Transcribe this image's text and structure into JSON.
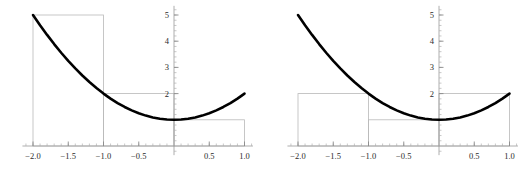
{
  "figure": {
    "title": "",
    "background": "#ffffff",
    "curve_color": "#000000",
    "rect_color": "#b9b9b9",
    "axis_color": "#9a9a9a",
    "label_color": "#2b2b2b"
  },
  "chart_data": [
    {
      "type": "line",
      "panel": "left",
      "title": "",
      "subtitle": "",
      "xlabel": "",
      "ylabel": "",
      "xlim": [
        -2.15,
        1.12
      ],
      "ylim": [
        -0.35,
        5.35
      ],
      "grid": false,
      "legend": null,
      "function": "f(x) = x^2 + 1",
      "x_ticks": [
        -2.0,
        -1.5,
        -1.0,
        -0.5,
        0.5,
        1.0
      ],
      "x_tick_labels": [
        "-2.0",
        "-1.5",
        "-1.0",
        "-0.5",
        "0.5",
        "1.0"
      ],
      "y_ticks": [
        1,
        2,
        3,
        4,
        5
      ],
      "y_tick_labels": [
        "1",
        "2",
        "3",
        "4",
        "5"
      ],
      "y_tick_labels_shown": [
        "2",
        "3",
        "4",
        "5"
      ],
      "x_minor_step": 0.1,
      "y_minor_step": 0.2,
      "series": [
        {
          "name": "f(x) = x^2 + 1",
          "x": [
            -2.0,
            -1.9,
            -1.8,
            -1.7,
            -1.6,
            -1.5,
            -1.4,
            -1.3,
            -1.2,
            -1.1,
            -1.0,
            -0.9,
            -0.8,
            -0.7,
            -0.6,
            -0.5,
            -0.4,
            -0.3,
            -0.2,
            -0.1,
            0.0,
            0.1,
            0.2,
            0.3,
            0.4,
            0.5,
            0.6,
            0.7,
            0.8,
            0.9,
            1.0
          ],
          "values": [
            5.0,
            4.61,
            4.24,
            3.89,
            3.56,
            3.25,
            2.96,
            2.69,
            2.44,
            2.21,
            2.0,
            1.81,
            1.64,
            1.49,
            1.36,
            1.25,
            1.16,
            1.09,
            1.04,
            1.01,
            1.0,
            1.01,
            1.04,
            1.09,
            1.16,
            1.25,
            1.36,
            1.49,
            1.64,
            1.81,
            2.0
          ]
        }
      ],
      "rectangles": {
        "rule": "left-endpoint",
        "count": 3,
        "width": 1.0,
        "items": [
          {
            "x0": -2.0,
            "x1": -1.0,
            "height": 5.0
          },
          {
            "x0": -1.0,
            "x1": 0.0,
            "height": 2.0
          },
          {
            "x0": 0.0,
            "x1": 1.0,
            "height": 1.0
          }
        ],
        "sum": 8.0
      }
    },
    {
      "type": "line",
      "panel": "right",
      "title": "",
      "subtitle": "",
      "xlabel": "",
      "ylabel": "",
      "xlim": [
        -2.15,
        1.12
      ],
      "ylim": [
        -0.35,
        5.35
      ],
      "grid": false,
      "legend": null,
      "function": "f(x) = x^2 + 1",
      "x_ticks": [
        -2.0,
        -1.5,
        -1.0,
        -0.5,
        0.5,
        1.0
      ],
      "x_tick_labels": [
        "-2.0",
        "-1.5",
        "-1.0",
        "-0.5",
        "0.5",
        "1.0"
      ],
      "y_ticks": [
        1,
        2,
        3,
        4,
        5
      ],
      "y_tick_labels": [
        "1",
        "2",
        "3",
        "4",
        "5"
      ],
      "y_tick_labels_shown": [
        "2",
        "3",
        "4",
        "5"
      ],
      "x_minor_step": 0.1,
      "y_minor_step": 0.2,
      "series": [
        {
          "name": "f(x) = x^2 + 1",
          "x": [
            -2.0,
            -1.9,
            -1.8,
            -1.7,
            -1.6,
            -1.5,
            -1.4,
            -1.3,
            -1.2,
            -1.1,
            -1.0,
            -0.9,
            -0.8,
            -0.7,
            -0.6,
            -0.5,
            -0.4,
            -0.3,
            -0.2,
            -0.1,
            0.0,
            0.1,
            0.2,
            0.3,
            0.4,
            0.5,
            0.6,
            0.7,
            0.8,
            0.9,
            1.0
          ],
          "values": [
            5.0,
            4.61,
            4.24,
            3.89,
            3.56,
            3.25,
            2.96,
            2.69,
            2.44,
            2.21,
            2.0,
            1.81,
            1.64,
            1.49,
            1.36,
            1.25,
            1.16,
            1.09,
            1.04,
            1.01,
            1.0,
            1.01,
            1.04,
            1.09,
            1.16,
            1.25,
            1.36,
            1.49,
            1.64,
            1.81,
            2.0
          ]
        }
      ],
      "rectangles": {
        "rule": "right-endpoint",
        "count": 3,
        "width": 1.0,
        "items": [
          {
            "x0": -2.0,
            "x1": -1.0,
            "height": 2.0
          },
          {
            "x0": -1.0,
            "x1": 0.0,
            "height": 1.0
          },
          {
            "x0": 0.0,
            "x1": 1.0,
            "height": 2.0
          }
        ],
        "sum": 5.0
      }
    }
  ]
}
